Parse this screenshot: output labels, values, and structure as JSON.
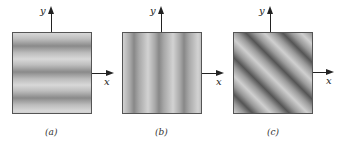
{
  "figure": {
    "panels": [
      {
        "id": "a",
        "caption": "(a)",
        "x_label": "x",
        "y_label": "y",
        "pattern": "horizontal fringes (variation along y)"
      },
      {
        "id": "b",
        "caption": "(b)",
        "x_label": "x",
        "y_label": "y",
        "pattern": "vertical fringes (variation along x)"
      },
      {
        "id": "c",
        "caption": "(c)",
        "x_label": "x",
        "y_label": "y",
        "pattern": "diagonal fringes (variation along x and y)"
      }
    ]
  }
}
